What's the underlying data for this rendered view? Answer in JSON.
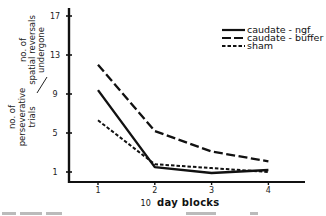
{
  "chart_data": {
    "type": "line",
    "title": "",
    "xlabel": "10 day blocks",
    "xlabel_parts": {
      "prefix": "10",
      "rest": "day blocks"
    },
    "ylabel": {
      "numerator": [
        "no. of",
        "perseverative",
        "trials"
      ],
      "denominator": [
        "no. of",
        "spatial reversals",
        "undergone"
      ],
      "separator": "/"
    },
    "x": [
      1,
      2,
      3,
      4
    ],
    "x_ticks": [
      "1",
      "2",
      "3",
      "4"
    ],
    "y_ticks": [
      "1",
      "5",
      "9",
      "13",
      "17"
    ],
    "ylim": [
      0,
      17.5
    ],
    "xlim": [
      0.5,
      4.8
    ],
    "grid": false,
    "legend_position": "upper right",
    "series": [
      {
        "name": "caudate - ngf",
        "style": "solid",
        "values": [
          9.4,
          1.5,
          0.9,
          1.2
        ]
      },
      {
        "name": "caudate - buffer",
        "style": "long-dash",
        "values": [
          12.0,
          5.2,
          3.1,
          2.1
        ]
      },
      {
        "name": "sham",
        "style": "short-dash",
        "values": [
          6.3,
          1.8,
          1.4,
          1.0
        ]
      }
    ]
  },
  "legend": {
    "items": [
      {
        "label": "caudate - ngf",
        "style": "solid"
      },
      {
        "label": "caudate - buffer",
        "style": "long-dash"
      },
      {
        "label": "sham",
        "style": "short-dash"
      }
    ]
  }
}
